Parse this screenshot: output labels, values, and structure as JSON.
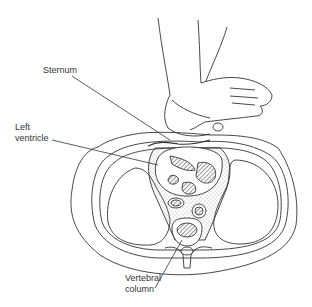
{
  "diagram": {
    "type": "anatomical cross-section",
    "labels": {
      "sternum": "Sternum",
      "left_ventricle_line1": "Left",
      "left_ventricle_line2": "ventricle",
      "vertebral_line1": "Vertebral",
      "vertebral_line2": "column"
    },
    "colors": {
      "ink": "#333333",
      "background": "#ffffff"
    }
  }
}
